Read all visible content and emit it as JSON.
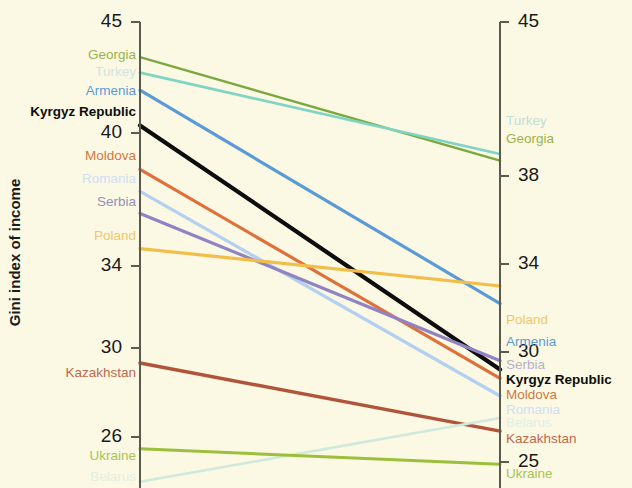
{
  "chart_data": {
    "type": "line",
    "subtype": "slope-chart",
    "title": "",
    "left_axis": {
      "label": "Gini index of income",
      "ticks": [
        45,
        40,
        34,
        30,
        26
      ],
      "range": [
        23.9,
        45.0
      ]
    },
    "right_axis": {
      "label": "Gini index of consumption expenditure",
      "ticks": [
        45,
        38,
        34,
        30,
        25
      ],
      "range": [
        23.9,
        45.0
      ]
    },
    "grid": false,
    "legend": "inline-endpoint-labels",
    "series": [
      {
        "name": "Georgia",
        "color": "#7aa83f",
        "left": 43.4,
        "right": 38.7,
        "left_faded": false,
        "right_faded": false,
        "bold": false,
        "width": 2.4
      },
      {
        "name": "Turkey",
        "color": "#7fd4c4",
        "left": 42.7,
        "right": 39.0,
        "left_faded": true,
        "right_faded": true,
        "bold": false,
        "width": 2.8
      },
      {
        "name": "Armenia",
        "color": "#5b9bd5",
        "left": 41.9,
        "right": 32.2,
        "left_faded": false,
        "right_faded": false,
        "bold": false,
        "width": 3.2
      },
      {
        "name": "Kyrgyz Republic",
        "color": "#0d0d0d",
        "left": 40.3,
        "right": 29.2,
        "left_faded": false,
        "right_faded": false,
        "bold": true,
        "width": 4.2
      },
      {
        "name": "Moldova",
        "color": "#e0703a",
        "left": 38.3,
        "right": 28.8,
        "left_faded": false,
        "right_faded": false,
        "bold": false,
        "width": 3.2
      },
      {
        "name": "Romania",
        "color": "#b3d0f0",
        "left": 37.3,
        "right": 28.0,
        "left_faded": true,
        "right_faded": true,
        "bold": false,
        "width": 3.2
      },
      {
        "name": "Serbia",
        "color": "#9083c4",
        "left": 36.3,
        "right": 29.6,
        "left_faded": false,
        "right_faded": true,
        "bold": false,
        "width": 3.2
      },
      {
        "name": "Poland",
        "color": "#f2be4a",
        "left": 34.7,
        "right": 33.0,
        "left_faded": true,
        "right_faded": true,
        "bold": false,
        "width": 3.2
      },
      {
        "name": "Kazakhstan",
        "color": "#b0543a",
        "left": 29.5,
        "right": 26.4,
        "left_faded": false,
        "right_faded": false,
        "bold": false,
        "width": 3.4
      },
      {
        "name": "Belarus",
        "color": "#cfeadd",
        "left": 24.1,
        "right": 27.0,
        "left_faded": true,
        "right_faded": true,
        "bold": false,
        "width": 2.6
      },
      {
        "name": "Ukraine",
        "color": "#9cbf3c",
        "left": 25.6,
        "right": 24.9,
        "left_faded": false,
        "right_faded": false,
        "bold": false,
        "width": 3.0
      }
    ]
  },
  "left_axis_title": "Gini index of income",
  "right_axis_title": "Gini index of consumption expenditure",
  "left_ticks": [
    {
      "value": "45",
      "y": 22
    },
    {
      "value": "40",
      "y": 133
    },
    {
      "value": "34",
      "y": 266
    },
    {
      "value": "30",
      "y": 348
    },
    {
      "value": "26",
      "y": 437
    }
  ],
  "right_ticks": [
    {
      "value": "45",
      "y": 22
    },
    {
      "value": "38",
      "y": 176
    },
    {
      "value": "34",
      "y": 264
    },
    {
      "value": "30",
      "y": 352
    },
    {
      "value": "25",
      "y": 462
    }
  ],
  "left_labels": [
    {
      "name": "Georgia",
      "y": 56,
      "color": "#9bb34e",
      "bold": false
    },
    {
      "name": "Turkey",
      "y": 73,
      "color": "#cfe4e0",
      "bold": false
    },
    {
      "name": "Armenia",
      "y": 92,
      "color": "#5b9bd5",
      "bold": false
    },
    {
      "name": "Kyrgyz Republic",
      "y": 113,
      "color": "#0d0d0d",
      "bold": true
    },
    {
      "name": "Moldova",
      "y": 157,
      "color": "#d2783e",
      "bold": false
    },
    {
      "name": "Romania",
      "y": 180,
      "color": "#cfe0f2",
      "bold": false
    },
    {
      "name": "Serbia",
      "y": 203,
      "color": "#9490b8",
      "bold": false
    },
    {
      "name": "Poland",
      "y": 237,
      "color": "#efc76a",
      "bold": false
    },
    {
      "name": "Kazakhstan",
      "y": 374,
      "color": "#c0684a",
      "bold": false
    },
    {
      "name": "Ukraine",
      "y": 457,
      "color": "#a8c455",
      "bold": false
    },
    {
      "name": "Belarus",
      "y": 478,
      "color": "#e4efe0",
      "bold": false
    }
  ],
  "right_labels": [
    {
      "name": "Turkey",
      "y": 122,
      "color": "#bfdfd8",
      "bold": false
    },
    {
      "name": "Georgia",
      "y": 140,
      "color": "#9bb34e",
      "bold": false
    },
    {
      "name": "Poland",
      "y": 321,
      "color": "#efc76a",
      "bold": false
    },
    {
      "name": "Armenia",
      "y": 343,
      "color": "#5b9bd5",
      "bold": false
    },
    {
      "name": "Serbia",
      "y": 366,
      "color": "#b6b2cc",
      "bold": false
    },
    {
      "name": "Kyrgyz Republic",
      "y": 381,
      "color": "#0d0d0d",
      "bold": true
    },
    {
      "name": "Moldova",
      "y": 396,
      "color": "#d2783e",
      "bold": false
    },
    {
      "name": "Romania",
      "y": 411,
      "color": "#cfe0f2",
      "bold": false
    },
    {
      "name": "Belarus",
      "y": 424,
      "color": "#e0eee6",
      "bold": false
    },
    {
      "name": "Kazakhstan",
      "y": 440,
      "color": "#c0684a",
      "bold": false
    },
    {
      "name": "Ukraine",
      "y": 475,
      "color": "#a8c455",
      "bold": false
    }
  ],
  "geometry": {
    "x_left": 140,
    "x_right": 500,
    "y_at_45": 22,
    "px_per_unit": 22.0,
    "background": "#fbf8e4",
    "axis_color": "#5a5a4e"
  }
}
